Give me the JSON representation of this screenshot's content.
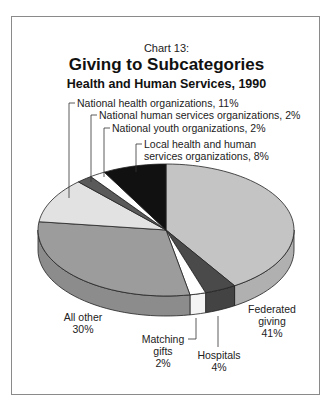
{
  "chart_data": {
    "type": "pie",
    "chart_number": "Chart 13:",
    "title": "Giving to Subcategories",
    "subtitle": "Health and Human Services, 1990",
    "style": "3d-pie",
    "slices": [
      {
        "label": "Federated giving",
        "value": 41,
        "display": "41%",
        "color": "#c4c4c4"
      },
      {
        "label": "Hospitals",
        "value": 4,
        "display": "4%",
        "color": "#4a4a4a"
      },
      {
        "label": "Matching gifts",
        "value": 2,
        "display": "2%",
        "color": "#ffffff"
      },
      {
        "label": "All other",
        "value": 30,
        "display": "30%",
        "color": "#9c9c9c"
      },
      {
        "label": "National health organizations",
        "value": 11,
        "display": "11%",
        "color": "#e2e2e2"
      },
      {
        "label": "National human services organizations",
        "value": 2,
        "display": "2%",
        "color": "#5a5a5a"
      },
      {
        "label": "National youth organizations",
        "value": 2,
        "display": "2%",
        "color": "#ffffff"
      },
      {
        "label": "Local health and human services organizations",
        "value": 8,
        "display": "8%",
        "color": "#111111"
      }
    ]
  },
  "labels": {
    "national_health": "National health organizations, 11%",
    "national_human": "National human services organizations, 2%",
    "national_youth": "National youth organizations, 2%",
    "local_line1": "Local health and human",
    "local_line2": "services organizations, 8%",
    "all_other_line1": "All other",
    "all_other_line2": "30%",
    "matching_line1": "Matching",
    "matching_line2": "gifts",
    "matching_line3": "2%",
    "hospitals_line1": "Hospitals",
    "hospitals_line2": "4%",
    "federated_line1": "Federated",
    "federated_line2": "giving",
    "federated_line3": "41%"
  }
}
